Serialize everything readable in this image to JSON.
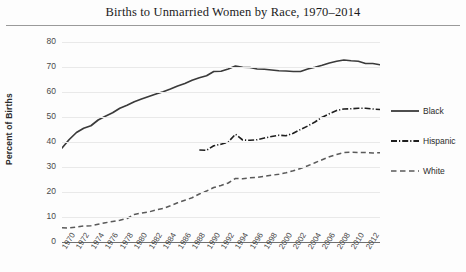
{
  "chart": {
    "title": "Births to Unmarried Women by Race, 1970–2014",
    "ylabel": "Percent of Births",
    "xlabel": ""
  },
  "legend": {
    "position": "right",
    "items": [
      {
        "label": "Black",
        "style": "solid",
        "color": "#3a3a3a",
        "swatch": "legend-line-solid"
      },
      {
        "label": "Hispanic",
        "style": "dashdot",
        "color": "#1f1f1f",
        "swatch": "legend-line-dashdot"
      },
      {
        "label": "White",
        "style": "dashed",
        "color": "#5a5a5a",
        "swatch": "legend-line-dashed"
      }
    ]
  },
  "axes": {
    "y_ticks": [
      "80",
      "70",
      "60",
      "50",
      "40",
      "30",
      "20",
      "10",
      "0"
    ],
    "x_ticks": [
      "1970",
      "1972",
      "1974",
      "1976",
      "1978",
      "1980",
      "1982",
      "1984",
      "1986",
      "1988",
      "1990",
      "1992",
      "1994",
      "1996",
      "1998",
      "2000",
      "2002",
      "2004",
      "2006",
      "2008",
      "2010",
      "2012"
    ]
  },
  "chart_data": {
    "type": "line",
    "title": "Births to Unmarried Women by Race, 1970–2014",
    "xlabel": "",
    "ylabel": "Percent of Births",
    "xlim": [
      1970,
      2014
    ],
    "ylim": [
      0,
      80
    ],
    "grid": true,
    "legend_position": "right",
    "x": [
      1970,
      1971,
      1972,
      1973,
      1974,
      1975,
      1976,
      1977,
      1978,
      1979,
      1980,
      1981,
      1982,
      1983,
      1984,
      1985,
      1986,
      1987,
      1988,
      1989,
      1990,
      1991,
      1992,
      1993,
      1994,
      1995,
      1996,
      1997,
      1998,
      1999,
      2000,
      2001,
      2002,
      2003,
      2004,
      2005,
      2006,
      2007,
      2008,
      2009,
      2010,
      2011,
      2012,
      2013,
      2014
    ],
    "series": [
      {
        "name": "Black",
        "style": "solid",
        "color": "#3a3a3a",
        "values": [
          37.6,
          41.0,
          43.8,
          45.5,
          46.5,
          48.8,
          50.3,
          51.7,
          53.5,
          54.7,
          56.1,
          57.2,
          58.2,
          59.2,
          60.1,
          61.2,
          62.4,
          63.4,
          64.7,
          65.7,
          66.5,
          68.2,
          68.3,
          69.2,
          70.4,
          69.9,
          69.8,
          69.2,
          69.1,
          68.8,
          68.5,
          68.4,
          68.2,
          68.2,
          69.2,
          69.9,
          70.7,
          71.6,
          72.3,
          72.8,
          72.5,
          72.3,
          71.4,
          71.4,
          70.9
        ]
      },
      {
        "name": "Hispanic",
        "style": "dashdot",
        "color": "#1f1f1f",
        "values": [
          null,
          null,
          null,
          null,
          null,
          null,
          null,
          null,
          null,
          null,
          null,
          null,
          null,
          null,
          null,
          null,
          null,
          null,
          null,
          36.8,
          36.7,
          38.5,
          39.1,
          40.0,
          43.1,
          40.8,
          40.7,
          40.9,
          41.6,
          42.2,
          42.7,
          42.5,
          43.5,
          45.0,
          46.4,
          48.0,
          49.9,
          51.3,
          52.6,
          53.2,
          53.3,
          53.5,
          53.5,
          53.2,
          53.0
        ]
      },
      {
        "name": "White",
        "style": "dashed",
        "color": "#5a5a5a",
        "values": [
          5.7,
          5.6,
          6.0,
          6.4,
          6.5,
          7.1,
          7.7,
          8.2,
          8.7,
          9.4,
          11.0,
          11.6,
          12.0,
          12.8,
          13.4,
          14.5,
          15.7,
          16.7,
          17.7,
          19.2,
          20.4,
          21.8,
          22.6,
          23.6,
          25.4,
          25.3,
          25.7,
          25.8,
          26.3,
          26.7,
          27.1,
          27.7,
          28.5,
          29.4,
          30.5,
          31.7,
          32.9,
          34.1,
          35.0,
          35.8,
          35.9,
          35.8,
          35.8,
          35.6,
          35.7
        ]
      }
    ]
  }
}
